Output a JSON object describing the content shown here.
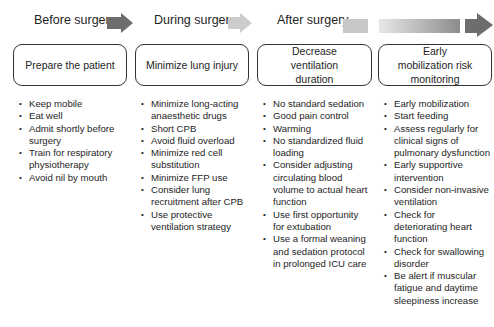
{
  "phases": [
    {
      "label": "Before surgery"
    },
    {
      "label": "During surgery"
    },
    {
      "label": "After surgery"
    }
  ],
  "arrows": {
    "before_color": "#6d6d6d",
    "during_color": "#cccccc",
    "after_bar_color": "#c8c8c8",
    "gradient_start": "#e6e6e6",
    "gradient_end": "#8a8a8a",
    "final_head_color": "#6d6d6d"
  },
  "columns": [
    {
      "title": "Prepare the patient",
      "items": [
        "Keep mobile",
        "Eat well",
        "Admit shortly before surgery",
        "Train for respiratory physiotherapy",
        "Avoid nil by mouth"
      ]
    },
    {
      "title": "Minimize lung injury",
      "items": [
        "Minimize long-acting anaesthetic drugs",
        "Short CPB",
        "Avoid fluid overload",
        "Minimize red cell substitution",
        "Minimize FFP use",
        "Consider lung recruitment after CPB",
        "Use protective ventilation strategy"
      ]
    },
    {
      "title": "Decrease ventilation duration",
      "items": [
        "No standard sedation",
        "Good pain control",
        "Warming",
        "No standardized fluid loading",
        "Consider adjusting circulating blood volume to actual heart function",
        "Use first opportunity for extubation",
        "Use a formal weaning and sedation protocol in prolonged ICU care"
      ]
    },
    {
      "title": "Early mobilization risk monitoring",
      "items": [
        "Early mobilization",
        "Start feeding",
        "Assess regularly for clinical signs of pulmonary dysfunction",
        "Early supportive intervention",
        "Consider non-invasive ventilation",
        "Check for deteriorating heart function",
        "Check for swallowing disorder",
        "Be alert if muscular fatigue and daytime sleepiness increase"
      ]
    }
  ]
}
